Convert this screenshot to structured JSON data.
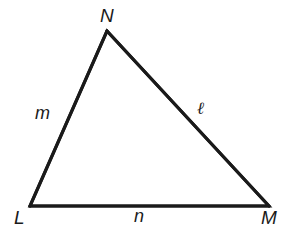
{
  "figure": {
    "name": "triangle-lmn",
    "background_color": "#ffffff",
    "stroke_color": "#1a1a1a",
    "stroke_width": 3,
    "canvas": {
      "width": 284,
      "height": 236
    }
  },
  "vertices": [
    {
      "id": "N",
      "label": "N",
      "x": 107,
      "y": 31
    },
    {
      "id": "L",
      "label": "L",
      "x": 30,
      "y": 206
    },
    {
      "id": "M",
      "label": "M",
      "x": 269,
      "y": 206
    }
  ],
  "sides": [
    {
      "id": "m",
      "label": "m",
      "from": "L",
      "to": "N",
      "opposite_vertex": "M"
    },
    {
      "id": "ell",
      "label": "ℓ",
      "from": "N",
      "to": "M",
      "opposite_vertex": "L"
    },
    {
      "id": "n",
      "label": "n",
      "from": "L",
      "to": "M",
      "opposite_vertex": "N"
    }
  ],
  "paths": {
    "outline": "M 30 206 L 107 31 L 269 206 Z",
    "side_LN": "M 30 206 L 107 31",
    "side_NM": "M 107 31 L 269 206",
    "side_LM": "M 30 206 L 269 206"
  }
}
